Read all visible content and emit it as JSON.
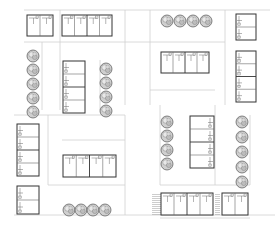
{
  "diagram": {
    "type": "site-plan",
    "colors": {
      "background": "#ffffff",
      "building_outline": "#333333",
      "unit_divider": "#6a6a6a",
      "path_line": "#d0d0d0",
      "tree_fill": "#cfcfcf",
      "tree_stroke": "#555555",
      "stair_hatch": "#9a9a9a"
    },
    "paths": [
      {
        "x1": 24,
        "y1": 10,
        "x2": 270,
        "y2": 10
      },
      {
        "x1": 24,
        "y1": 42,
        "x2": 150,
        "y2": 42
      },
      {
        "x1": 42,
        "y1": 42,
        "x2": 42,
        "y2": 110
      },
      {
        "x1": 60,
        "y1": 42,
        "x2": 60,
        "y2": 110
      },
      {
        "x1": 60,
        "y1": 10,
        "x2": 60,
        "y2": 42
      },
      {
        "x1": 100,
        "y1": 60,
        "x2": 100,
        "y2": 110
      },
      {
        "x1": 125,
        "y1": 10,
        "x2": 125,
        "y2": 105
      },
      {
        "x1": 150,
        "y1": 10,
        "x2": 150,
        "y2": 105
      },
      {
        "x1": 150,
        "y1": 42,
        "x2": 225,
        "y2": 42
      },
      {
        "x1": 225,
        "y1": 10,
        "x2": 225,
        "y2": 105
      },
      {
        "x1": 150,
        "y1": 90,
        "x2": 215,
        "y2": 90
      },
      {
        "x1": 14,
        "y1": 115,
        "x2": 125,
        "y2": 115
      },
      {
        "x1": 48,
        "y1": 115,
        "x2": 48,
        "y2": 185
      },
      {
        "x1": 48,
        "y1": 185,
        "x2": 125,
        "y2": 185
      },
      {
        "x1": 125,
        "y1": 115,
        "x2": 125,
        "y2": 215
      },
      {
        "x1": 62,
        "y1": 140,
        "x2": 125,
        "y2": 140
      },
      {
        "x1": 14,
        "y1": 215,
        "x2": 275,
        "y2": 215
      },
      {
        "x1": 160,
        "y1": 105,
        "x2": 160,
        "y2": 185
      },
      {
        "x1": 215,
        "y1": 105,
        "x2": 215,
        "y2": 185
      },
      {
        "x1": 160,
        "y1": 185,
        "x2": 250,
        "y2": 185
      },
      {
        "x1": 250,
        "y1": 115,
        "x2": 250,
        "y2": 185
      },
      {
        "x1": 160,
        "y1": 218,
        "x2": 250,
        "y2": 218
      }
    ],
    "buildings": [
      {
        "id": "block-a",
        "x": 27,
        "y": 15,
        "w": 26,
        "h": 21,
        "units": 2,
        "orient": "h"
      },
      {
        "id": "block-b",
        "x": 62,
        "y": 15,
        "w": 50,
        "h": 21,
        "units": 4,
        "orient": "h"
      },
      {
        "id": "block-c",
        "x": 63,
        "y": 61,
        "w": 22,
        "h": 52,
        "units": 4,
        "orient": "v"
      },
      {
        "id": "block-d",
        "x": 161,
        "y": 52,
        "w": 48,
        "h": 21,
        "units": 4,
        "orient": "h"
      },
      {
        "id": "block-e",
        "x": 236,
        "y": 14,
        "w": 20,
        "h": 26,
        "units": 2,
        "orient": "v"
      },
      {
        "id": "block-f",
        "x": 236,
        "y": 51,
        "w": 20,
        "h": 51,
        "units": 4,
        "orient": "v"
      },
      {
        "id": "block-g",
        "x": 17,
        "y": 124,
        "w": 22,
        "h": 52,
        "units": 4,
        "orient": "v"
      },
      {
        "id": "block-h",
        "x": 17,
        "y": 186,
        "w": 22,
        "h": 28,
        "units": 2,
        "orient": "v"
      },
      {
        "id": "block-i",
        "x": 63,
        "y": 155,
        "w": 53,
        "h": 22,
        "units": 4,
        "orient": "h"
      },
      {
        "id": "block-j",
        "x": 190,
        "y": 116,
        "w": 24,
        "h": 52,
        "units": 4,
        "orient": "v"
      },
      {
        "id": "block-k",
        "x": 161,
        "y": 193,
        "w": 52,
        "h": 22,
        "units": 4,
        "orient": "h"
      },
      {
        "id": "block-l",
        "x": 222,
        "y": 193,
        "w": 26,
        "h": 22,
        "units": 2,
        "orient": "h"
      }
    ],
    "stairs": [
      {
        "x": 152,
        "y": 193,
        "w": 9,
        "h": 22
      },
      {
        "x": 215,
        "y": 193,
        "w": 5,
        "h": 22
      }
    ],
    "tree_rows": [
      {
        "id": "trees-west",
        "x": 33,
        "y": 56,
        "count": 5,
        "dir": "v",
        "spacing": 14,
        "r": 6
      },
      {
        "id": "trees-mid-north",
        "x": 106,
        "y": 69,
        "count": 4,
        "dir": "v",
        "spacing": 14,
        "r": 6
      },
      {
        "id": "trees-top-right",
        "x": 167,
        "y": 21,
        "count": 4,
        "dir": "h",
        "spacing": 13,
        "r": 6
      },
      {
        "id": "trees-center-east",
        "x": 167,
        "y": 122,
        "count": 4,
        "dir": "v",
        "spacing": 14,
        "r": 6
      },
      {
        "id": "trees-east",
        "x": 242,
        "y": 122,
        "count": 5,
        "dir": "v",
        "spacing": 15,
        "r": 6
      },
      {
        "id": "trees-south",
        "x": 69,
        "y": 210,
        "count": 4,
        "dir": "h",
        "spacing": 12,
        "r": 6
      }
    ]
  }
}
